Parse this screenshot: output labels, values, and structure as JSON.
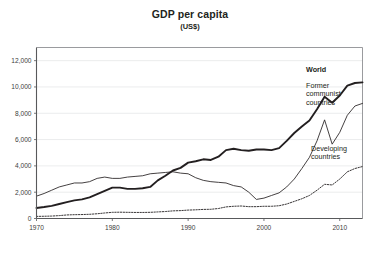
{
  "chart_data": {
    "type": "line",
    "title": "GDP per capita",
    "subtitle": "(US$)",
    "xlabel": "",
    "ylabel": "",
    "xlim": [
      1970,
      2013
    ],
    "ylim": [
      0,
      13000
    ],
    "xticks": [
      "1970",
      "1980",
      "1990",
      "2000",
      "2010"
    ],
    "xtick_values": [
      1970,
      1980,
      1990,
      2000,
      2010
    ],
    "yticks": [
      "0",
      "2,000",
      "4,000",
      "6,000",
      "8,000",
      "10,000",
      "12,000"
    ],
    "ytick_values": [
      0,
      2000,
      4000,
      6000,
      8000,
      10000,
      12000
    ],
    "grid": true,
    "legend_position": "inline-right",
    "x": [
      1970,
      1971,
      1972,
      1973,
      1974,
      1975,
      1976,
      1977,
      1978,
      1979,
      1980,
      1981,
      1982,
      1983,
      1984,
      1985,
      1986,
      1987,
      1988,
      1989,
      1990,
      1991,
      1992,
      1993,
      1994,
      1995,
      1996,
      1997,
      1998,
      1999,
      2000,
      2001,
      2002,
      2003,
      2004,
      2005,
      2006,
      2007,
      2008,
      2009,
      2010,
      2011,
      2012,
      2013
    ],
    "series": [
      {
        "name": "World",
        "style": "solid-bold",
        "color": "#231f20",
        "values": [
          800,
          870,
          960,
          1100,
          1250,
          1380,
          1450,
          1600,
          1850,
          2100,
          2350,
          2350,
          2250,
          2250,
          2300,
          2400,
          2900,
          3250,
          3650,
          3850,
          4250,
          4350,
          4500,
          4450,
          4700,
          5200,
          5300,
          5200,
          5150,
          5250,
          5250,
          5200,
          5350,
          5900,
          6500,
          7000,
          7450,
          8300,
          9250,
          8800,
          9350,
          10100,
          10300,
          10350
        ]
      },
      {
        "name": "Former communist countries",
        "style": "solid-thin",
        "color": "#231f20",
        "values": [
          1700,
          1900,
          2150,
          2400,
          2550,
          2700,
          2700,
          2800,
          3050,
          3150,
          3050,
          3050,
          3150,
          3200,
          3250,
          3400,
          3450,
          3500,
          3550,
          3450,
          3400,
          3100,
          2900,
          2800,
          2750,
          2700,
          2500,
          2400,
          2000,
          1450,
          1550,
          1750,
          1950,
          2400,
          3000,
          3800,
          4650,
          5900,
          7500,
          5650,
          6550,
          7850,
          8550,
          8750
        ]
      },
      {
        "name": "Developing countries",
        "style": "dotted",
        "color": "#231f20",
        "values": [
          160,
          170,
          185,
          220,
          270,
          290,
          300,
          320,
          360,
          420,
          470,
          480,
          470,
          460,
          460,
          470,
          500,
          530,
          580,
          600,
          640,
          660,
          690,
          700,
          760,
          880,
          930,
          950,
          900,
          900,
          930,
          930,
          970,
          1100,
          1300,
          1500,
          1750,
          2150,
          2600,
          2550,
          3000,
          3550,
          3800,
          3950
        ]
      }
    ],
    "annotations": [
      {
        "name": "World",
        "text": "World",
        "x": 306,
        "y": 72,
        "bold": true,
        "lines": [
          "World"
        ]
      },
      {
        "name": "Former communist countries",
        "text": "Former communist countries",
        "x": 306,
        "y": 88,
        "bold": false,
        "lines": [
          "Former",
          "communist",
          "countries"
        ]
      },
      {
        "name": "Developing countries",
        "text": "Developing countries",
        "x": 311,
        "y": 151,
        "bold": false,
        "lines": [
          "Developing",
          "countries"
        ]
      }
    ],
    "colors": {
      "axis": "#58595b",
      "grid": "#e6e7e8",
      "frame": "#808285",
      "text": "#231f20",
      "background": "#ffffff"
    }
  }
}
